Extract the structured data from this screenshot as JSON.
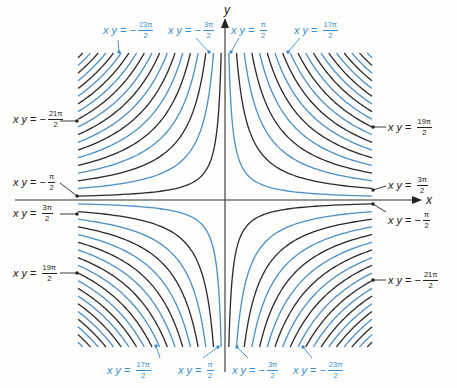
{
  "diagram": {
    "axes": {
      "x_label": "x",
      "y_label": "y"
    },
    "colors": {
      "blue": "#4a8fc8",
      "black": "#2a2a2a",
      "blue_text": "#3a8ed0",
      "black_text": "#222222",
      "axis": "#333333",
      "background": "#fdfdfb"
    },
    "labels": {
      "top": [
        {
          "lhs": "x y",
          "sign": "−",
          "num": "23π",
          "den": "2",
          "color": "blue"
        },
        {
          "lhs": "x y",
          "sign": "−",
          "num": "3π",
          "den": "2",
          "color": "blue"
        },
        {
          "lhs": "x y",
          "sign": "",
          "num": "π",
          "den": "2",
          "color": "blue"
        },
        {
          "lhs": "x y",
          "sign": "",
          "num": "17π",
          "den": "2",
          "color": "blue"
        }
      ],
      "left": [
        {
          "lhs": "x y",
          "sign": "−",
          "num": "21π",
          "den": "2",
          "color": "black"
        },
        {
          "lhs": "x y",
          "sign": "−",
          "num": "π",
          "den": "2",
          "color": "black"
        },
        {
          "lhs": "x y",
          "sign": "",
          "num": "3π",
          "den": "2",
          "color": "black"
        },
        {
          "lhs": "x y",
          "sign": "",
          "num": "19π",
          "den": "2",
          "color": "black"
        }
      ],
      "right": [
        {
          "lhs": "x y",
          "sign": "",
          "num": "19π",
          "den": "2",
          "color": "black"
        },
        {
          "lhs": "x y",
          "sign": "",
          "num": "3π",
          "den": "2",
          "color": "black"
        },
        {
          "lhs": "x y",
          "sign": "−",
          "num": "π",
          "den": "2",
          "color": "black"
        },
        {
          "lhs": "x y",
          "sign": "−",
          "num": "21π",
          "den": "2",
          "color": "black"
        }
      ],
      "bottom": [
        {
          "lhs": "x y",
          "sign": "",
          "num": "17π",
          "den": "2",
          "color": "blue"
        },
        {
          "lhs": "x y",
          "sign": "",
          "num": "π",
          "den": "2",
          "color": "blue"
        },
        {
          "lhs": "x y",
          "sign": "−",
          "num": "3π",
          "den": "2",
          "color": "blue"
        },
        {
          "lhs": "x y",
          "sign": "−",
          "num": "23π",
          "den": "2",
          "color": "blue"
        }
      ]
    }
  },
  "chart_data": {
    "type": "contour",
    "title": "",
    "xlabel": "x",
    "ylabel": "y",
    "equation": "xy = n·π/2, n odd",
    "n_values_positive": [
      1,
      3,
      5,
      7,
      9,
      11,
      13,
      15,
      17,
      19,
      21,
      23,
      25,
      27,
      29,
      31,
      33,
      35,
      37
    ],
    "n_values_negative": [
      -1,
      -3,
      -5,
      -7,
      -9,
      -11,
      -13,
      -15,
      -17,
      -19,
      -21,
      -23,
      -25,
      -27,
      -29,
      -31,
      -33,
      -35,
      -37
    ],
    "color_rule": "xy>0: n≡1 (mod 4) blue, n≡3 (mod 4) black; xy<0: |n|≡1 (mod 4) black, |n|≡3 (mod 4) blue",
    "labeled_curves": [
      "-23π/2",
      "-21π/2",
      "-3π/2",
      "-π/2",
      "π/2",
      "3π/2",
      "17π/2",
      "19π/2"
    ],
    "grid": false,
    "legend": "none"
  }
}
